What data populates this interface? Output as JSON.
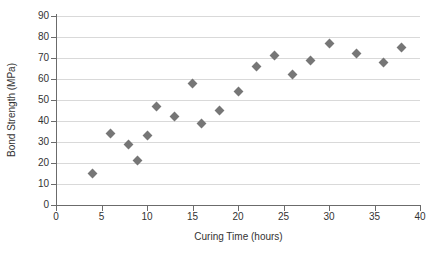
{
  "chart_data": {
    "type": "scatter",
    "title": "",
    "xlabel": "Curing Time (hours)",
    "ylabel": "Bond Strength (MPa)",
    "xlim": [
      0,
      40
    ],
    "ylim": [
      0,
      90
    ],
    "xticks": [
      0,
      5,
      10,
      15,
      20,
      25,
      30,
      35,
      40
    ],
    "yticks": [
      0,
      10,
      20,
      30,
      40,
      50,
      60,
      70,
      80,
      90
    ],
    "grid": "horizontal",
    "legend": "none",
    "marker": "diamond",
    "marker_color": "#767676",
    "x": [
      4,
      6,
      8,
      9,
      10,
      11,
      13,
      15,
      16,
      18,
      20,
      22,
      24,
      26,
      28,
      30,
      33,
      36,
      38
    ],
    "y": [
      15,
      34,
      29,
      21,
      33,
      47,
      42,
      58,
      39,
      45,
      54,
      66,
      71,
      62,
      69,
      77,
      72,
      68,
      75
    ],
    "points": [
      {
        "x": 4,
        "y": 15
      },
      {
        "x": 6,
        "y": 34
      },
      {
        "x": 8,
        "y": 29
      },
      {
        "x": 9,
        "y": 21
      },
      {
        "x": 10,
        "y": 33
      },
      {
        "x": 11,
        "y": 47
      },
      {
        "x": 13,
        "y": 42
      },
      {
        "x": 15,
        "y": 58
      },
      {
        "x": 16,
        "y": 39
      },
      {
        "x": 18,
        "y": 45
      },
      {
        "x": 20,
        "y": 54
      },
      {
        "x": 22,
        "y": 66
      },
      {
        "x": 24,
        "y": 71
      },
      {
        "x": 26,
        "y": 62
      },
      {
        "x": 28,
        "y": 69
      },
      {
        "x": 30,
        "y": 77
      },
      {
        "x": 33,
        "y": 72
      },
      {
        "x": 36,
        "y": 68
      },
      {
        "x": 38,
        "y": 75
      }
    ]
  }
}
